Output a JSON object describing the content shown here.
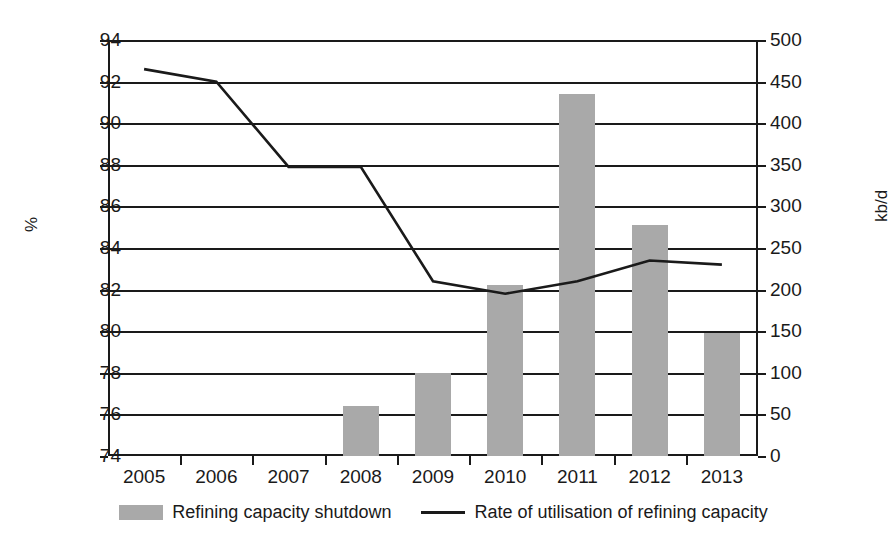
{
  "chart_data": {
    "type": "bar",
    "title": "",
    "subtitle": "",
    "categories": [
      "2005",
      "2006",
      "2007",
      "2008",
      "2009",
      "2010",
      "2011",
      "2012",
      "2013"
    ],
    "xlabel": "",
    "ylabel": "%",
    "ylabel_right": "kb/d",
    "ylim": [
      74,
      94
    ],
    "ylim_right": [
      0,
      500
    ],
    "yticks": [
      "74",
      "76",
      "78",
      "80",
      "82",
      "84",
      "86",
      "88",
      "90",
      "92",
      "94"
    ],
    "ytick_values": [
      74,
      76,
      78,
      80,
      82,
      84,
      86,
      88,
      90,
      92,
      94
    ],
    "yticks_right": [
      "0",
      "50",
      "100",
      "150",
      "200",
      "250",
      "300",
      "350",
      "400",
      "450",
      "500"
    ],
    "ytick_values_right": [
      0,
      50,
      100,
      150,
      200,
      250,
      300,
      350,
      400,
      450,
      500
    ],
    "grid": true,
    "legend_position": "bottom",
    "series": [
      {
        "name": "Refining capacity shutdown",
        "type": "bar",
        "axis": "right",
        "unit": "kb/d",
        "color": "#a9a9a9",
        "values": [
          null,
          null,
          null,
          60,
          100,
          205,
          435,
          278,
          148
        ]
      },
      {
        "name": "Rate of utilisation of refining capacity",
        "type": "line",
        "axis": "left",
        "unit": "%",
        "color": "#1a1a1a",
        "values": [
          92.6,
          92.0,
          87.9,
          87.9,
          82.4,
          81.8,
          82.4,
          83.4,
          83.2
        ]
      }
    ]
  },
  "legend": {
    "items": [
      {
        "label": "Refining capacity shutdown",
        "marker": "bar-swatch",
        "color": "#a9a9a9"
      },
      {
        "label": "Rate of utilisation of refining capacity",
        "marker": "line-swatch",
        "color": "#1a1a1a"
      }
    ]
  }
}
